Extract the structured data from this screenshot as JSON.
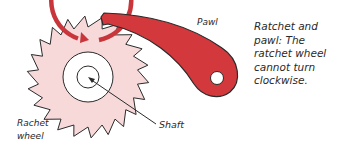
{
  "diagram": {
    "title": "Ratchet and pawl",
    "labels": {
      "pawl": "Pawl",
      "ratchet_wheel_line1": "Rachet",
      "ratchet_wheel_line2": "wheel",
      "shaft": "Shaft"
    },
    "caption": "Ratchet and pawl: The ratchet wheel cannot turn clockwise.",
    "colors": {
      "wheel_fill": "#f7d9da",
      "pawl_fill": "#d2383c",
      "ring_stroke": "#c8353a",
      "outline": "#2a2a2a",
      "background": "#ffffff"
    },
    "components": [
      "ratchet-wheel",
      "pawl",
      "shaft",
      "rotation-arrow"
    ]
  }
}
